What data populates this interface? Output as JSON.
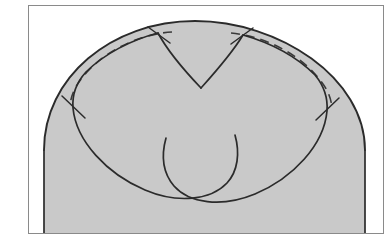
{
  "figure": {
    "kind": "medical-line-drawing",
    "canvas": {
      "width": 389,
      "height": 244
    },
    "colors": {
      "page_background": "#ffffff",
      "tissue_fill": "#c9c9c9",
      "outline_stroke": "#2b2b2b",
      "dashed_stroke": "#3a3a3a",
      "frame_stroke": "#8a8a8a"
    },
    "strokes": {
      "outline_width": 1.9,
      "leaflet_width": 1.7,
      "dashed_width": 1.6,
      "tick_width": 1.5,
      "frame_width": 1.0,
      "dash_pattern": "9 6"
    },
    "frame": {
      "x": 28,
      "y": 5,
      "width": 355,
      "height": 228
    },
    "geometry": {
      "tissue_dome": "M 44 233 L 44 150 C 44 78 111 21 195 21 C 279 21 365 78 365 150 L 365 233 Z",
      "outer_wall_arc": "M 44 150 C 44 78 111 21 195 21 C 279 21 365 78 365 150",
      "left_dashed_suture": "M 172 32 C 140 34 107 50 87 72 C 76 84 71 94 70 106",
      "right_dashed_suture": "M 231 33 C 263 36 295 52 315 74 C 326 86 331 96 332 108",
      "left_leaflet": "M 158 33 C 131 40 104 54 86 72 C 75 84 72 95 73 108 C 76 141 107 174 145 190 C 178 204 211 200 227 183 C 238 171 240 153 235 135",
      "right_leaflet": "M 243 35 C 271 43 297 57 315 75 C 325 87 328 98 327 111 C 324 145 293 178 255 194 C 221 208 189 203 174 186 C 163 173 161 156 166 138",
      "left_commissure": "M 158 33 C 166 48 180 66 201 88",
      "right_commissure": "M 243 35 C 234 50 219 68 201 88",
      "leaflet_free_edge_left": "M 201 88 C 196 108 183 133 162 155",
      "leaflet_free_edge_right": "M 201 88 C 206 110 214 133 230 155",
      "ticks": [
        {
          "name": "tick-left-upper",
          "d": "M 148 27 L 170 43"
        },
        {
          "name": "tick-left-lower",
          "d": "M 62 96 L 85 118"
        },
        {
          "name": "tick-right-upper",
          "d": "M 253 28 L 231 44"
        },
        {
          "name": "tick-right-lower",
          "d": "M 339 98 L 316 120"
        }
      ]
    },
    "parts": [
      {
        "id": "tissue-dome",
        "label": "vessel wall (gray tissue)"
      },
      {
        "id": "left-leaflet",
        "label": "left leaflet lobe"
      },
      {
        "id": "right-leaflet",
        "label": "right leaflet lobe"
      },
      {
        "id": "left-commissure",
        "label": "left commissural line"
      },
      {
        "id": "right-commissure",
        "label": "right commissural line"
      },
      {
        "id": "left-dashed-suture",
        "label": "left dashed suture line"
      },
      {
        "id": "right-dashed-suture",
        "label": "right dashed suture line"
      }
    ],
    "labels": []
  }
}
